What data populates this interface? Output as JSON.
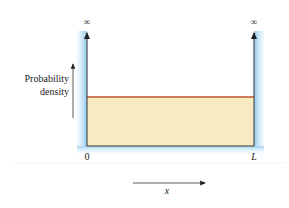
{
  "diagram": {
    "y_axis_label_line1": "Probability",
    "y_axis_label_line2": "density",
    "x_axis_label": "x",
    "left_wall_label": "0",
    "right_wall_label": "L",
    "left_wall_height_label": "∞",
    "right_wall_height_label": "∞",
    "colors": {
      "wall_glow": "#9fd0ee",
      "fill": "#f7ebc3",
      "density_line": "#c0522c",
      "axis": "#333333"
    }
  }
}
